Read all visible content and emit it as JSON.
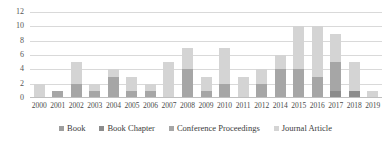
{
  "chart_data": {
    "type": "bar",
    "stacked": true,
    "title": "",
    "subtitle": "",
    "xlabel": "",
    "ylabel": "",
    "ylim": [
      0,
      12
    ],
    "yticks": [
      0,
      2,
      4,
      6,
      8,
      10,
      12
    ],
    "grid": true,
    "legend_position": "bottom",
    "categories": [
      "2000",
      "2001",
      "2002",
      "2003",
      "2004",
      "2005",
      "2006",
      "2007",
      "2008",
      "2009",
      "2010",
      "2011",
      "2012",
      "2014",
      "2015",
      "2016",
      "2017",
      "2018",
      "2019"
    ],
    "series": [
      {
        "name": "Book",
        "color": "#9e9e9e",
        "values": [
          0,
          0,
          0,
          0,
          0,
          0,
          0,
          0,
          0,
          0,
          0,
          0,
          0,
          0,
          0,
          0,
          0,
          0,
          0
        ]
      },
      {
        "name": "Book Chapter",
        "color": "#8c8c8c",
        "values": [
          0,
          0,
          0,
          0,
          0,
          0,
          0,
          0,
          0,
          0,
          0,
          0,
          0,
          0,
          0,
          0,
          1,
          1,
          0
        ]
      },
      {
        "name": "Conference Proceedings",
        "color": "#a6a6a6",
        "values": [
          0,
          1,
          2,
          1,
          3,
          1,
          1,
          0,
          4,
          1,
          2,
          0,
          2,
          4,
          4,
          3,
          4,
          0,
          0
        ]
      },
      {
        "name": "Journal Article",
        "color": "#d4d4d4",
        "values": [
          2,
          0,
          3,
          1,
          1,
          2,
          1,
          5,
          3,
          2,
          5,
          3,
          2,
          2,
          6,
          7,
          4,
          4,
          1
        ]
      }
    ],
    "totals": [
      2,
      1,
      5,
      2,
      4,
      3,
      2,
      5,
      7,
      3,
      7,
      3,
      4,
      6,
      10,
      10,
      9,
      5,
      1
    ]
  },
  "legend": {
    "items": [
      {
        "label": "Book"
      },
      {
        "label": "Book Chapter"
      },
      {
        "label": "Conference Proceedings"
      },
      {
        "label": "Journal Article"
      }
    ]
  }
}
